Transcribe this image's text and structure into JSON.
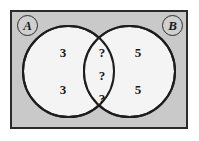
{
  "figure": {
    "kind": "venn-diagram",
    "universe": {
      "fill_color": "#c9c9c9",
      "border_color": "#2b2b2b"
    },
    "circle_fill_color": "#f4f4f4",
    "circle_border_color": "#1d1d1d",
    "labels": {
      "left_set": "A",
      "right_set": "B"
    },
    "regions": {
      "left_only": {
        "name": "A only",
        "values": [
          "3",
          "3"
        ]
      },
      "intersection": {
        "name": "A and B",
        "values": [
          "?",
          "?",
          "?"
        ]
      },
      "right_only": {
        "name": "B only",
        "values": [
          "5",
          "5"
        ]
      }
    }
  }
}
